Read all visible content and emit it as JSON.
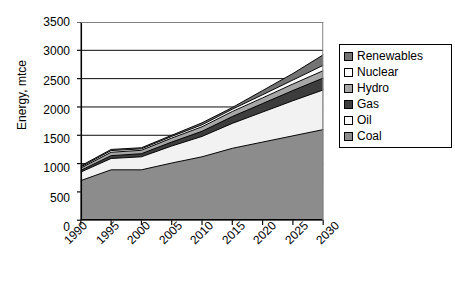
{
  "chart_data": {
    "type": "area",
    "stacked": true,
    "title": "",
    "xlabel": "",
    "ylabel": "Energy, mtce",
    "categories": [
      "1990",
      "1995",
      "2000",
      "2005",
      "2010",
      "2015",
      "2020",
      "2025",
      "2030"
    ],
    "x_tick_rotation": -45,
    "ylim": [
      0,
      3500
    ],
    "y_ticks": [
      0,
      500,
      1000,
      1500,
      2000,
      2500,
      3000,
      3500
    ],
    "y_tick_labels": [
      "0",
      "500",
      "1000",
      "1500",
      "2000",
      "2500",
      "3000",
      "3500"
    ],
    "grid": true,
    "grid_axis": "y",
    "legend_position": "right",
    "series": [
      {
        "name": "Coal",
        "color": "#8c8c8c",
        "values": [
          700,
          890,
          890,
          1010,
          1120,
          1270,
          1380,
          1490,
          1600
        ]
      },
      {
        "name": "Oil",
        "color": "#f2f2f2",
        "values": [
          150,
          200,
          230,
          300,
          360,
          440,
          530,
          620,
          700
        ]
      },
      {
        "name": "Gas",
        "color": "#3d3d3d",
        "values": [
          30,
          50,
          55,
          70,
          90,
          120,
          150,
          180,
          210
        ]
      },
      {
        "name": "Hydro",
        "color": "#a6a6a6",
        "values": [
          40,
          60,
          60,
          70,
          80,
          90,
          100,
          115,
          130
        ]
      },
      {
        "name": "Nuclear",
        "color": "#ffffff",
        "values": [
          20,
          30,
          25,
          30,
          35,
          40,
          55,
          70,
          95
        ]
      },
      {
        "name": "Renewables",
        "color": "#737373",
        "values": [
          20,
          20,
          20,
          20,
          35,
          30,
          75,
          115,
          185
        ]
      }
    ],
    "totals": [
      960,
      1250,
      1280,
      1500,
      1720,
      1990,
      2290,
      2590,
      2920
    ]
  },
  "legend": {
    "items": [
      {
        "label": "Renewables",
        "swatch": "#737373"
      },
      {
        "label": "Nuclear",
        "swatch": "#ffffff"
      },
      {
        "label": "Hydro",
        "swatch": "#a6a6a6"
      },
      {
        "label": "Gas",
        "swatch": "#3d3d3d"
      },
      {
        "label": "Oil",
        "swatch": "#fbfbfb"
      },
      {
        "label": "Coal",
        "swatch": "#8c8c8c"
      }
    ]
  },
  "colors": {
    "axis": "#000000",
    "grid": "#000000",
    "background": "#ffffff",
    "outline": "#000000"
  }
}
